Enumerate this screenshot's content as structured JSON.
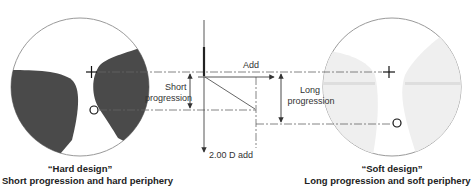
{
  "diagram": {
    "type": "progressive-lens-design-comparison",
    "labels": {
      "add": "Add",
      "short_progression_line1": "Short",
      "short_progression_line2": "progression",
      "long_progression_line1": "Long",
      "long_progression_line2": "progression",
      "add_value": "2.00 D add"
    },
    "left_lens": {
      "title": "“Hard design”",
      "subtitle": "Short progression and hard periphery",
      "zone_color": "#4a4a4a",
      "markers": [
        "+",
        "O"
      ]
    },
    "right_lens": {
      "title": "“Soft design”",
      "subtitle": "Long progression and soft periphery",
      "zone_color": "#ececec",
      "markers": [
        "+",
        "O"
      ]
    },
    "colors": {
      "outline": "#9a9a9a",
      "line": "#555555",
      "text": "#333333"
    }
  }
}
